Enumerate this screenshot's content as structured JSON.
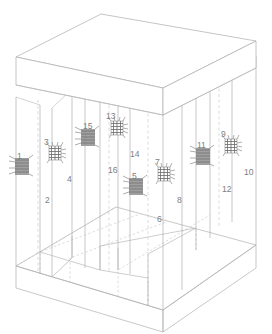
{
  "diagram": {
    "colors": {
      "outline": "#b0b0b0",
      "hidden_edge": "#c0c0c0",
      "label_text": "#7e7e7e",
      "coil_dark": "#6e6e6e",
      "coil_mid": "#8c8c8c",
      "grid_dark": "#707070",
      "background": "#ffffff"
    },
    "line_styles": {
      "visible": "solid",
      "hidden": "dashed"
    },
    "structure": {
      "top_slab_label": "top-slab",
      "bottom_slab_label": "bottom-slab",
      "column_count": 8,
      "column_label": "column"
    },
    "sensors": [
      {
        "id": "1",
        "type": "coil",
        "label": "1",
        "lx": 17,
        "ly": 152,
        "ex": 22,
        "ey": 166
      },
      {
        "id": "2",
        "type": "coil",
        "label": "2",
        "lx": 45,
        "ly": 196,
        "ex": 22,
        "ey": 166
      },
      {
        "id": "3",
        "type": "grid",
        "label": "3",
        "lx": 44,
        "ly": 138,
        "ex": 55,
        "ey": 153
      },
      {
        "id": "4",
        "type": "grid",
        "label": "4",
        "lx": 67,
        "ly": 175,
        "ex": 55,
        "ey": 153
      },
      {
        "id": "5",
        "type": "coil",
        "label": "5",
        "lx": 132,
        "ly": 172,
        "ex": 136,
        "ey": 186
      },
      {
        "id": "6",
        "type": "coil",
        "label": "6",
        "lx": 157,
        "ly": 215,
        "ex": 136,
        "ey": 186
      },
      {
        "id": "7",
        "type": "grid",
        "label": "7",
        "lx": 155,
        "ly": 158,
        "ex": 164,
        "ey": 174
      },
      {
        "id": "8",
        "type": "grid",
        "label": "8",
        "lx": 177,
        "ly": 196,
        "ex": 164,
        "ey": 174
      },
      {
        "id": "9",
        "type": "grid",
        "label": "9",
        "lx": 221,
        "ly": 130,
        "ex": 231,
        "ey": 146
      },
      {
        "id": "10",
        "type": "grid",
        "label": "10",
        "lx": 244,
        "ly": 168,
        "ex": 231,
        "ey": 146
      },
      {
        "id": "11",
        "type": "coil",
        "label": "11",
        "lx": 197,
        "ly": 141,
        "ex": 203,
        "ey": 156
      },
      {
        "id": "12",
        "type": "coil",
        "label": "12",
        "lx": 222,
        "ly": 185,
        "ex": 203,
        "ey": 156
      },
      {
        "id": "13",
        "type": "grid",
        "label": "13",
        "lx": 106,
        "ly": 112,
        "ex": 117,
        "ey": 128
      },
      {
        "id": "14",
        "type": "grid",
        "label": "14",
        "lx": 130,
        "ly": 150,
        "ex": 117,
        "ey": 128
      },
      {
        "id": "15",
        "type": "coil",
        "label": "15",
        "lx": 83,
        "ly": 122,
        "ex": 88,
        "ey": 137
      },
      {
        "id": "16",
        "type": "coil",
        "label": "16",
        "lx": 108,
        "ly": 166,
        "ex": 88,
        "ey": 137
      }
    ]
  }
}
